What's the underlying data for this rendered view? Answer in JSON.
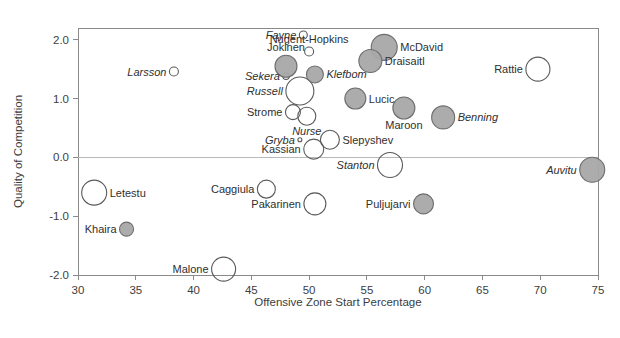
{
  "chart_data": {
    "type": "scatter",
    "title": "",
    "xlabel": "Offensive Zone Start Percentage",
    "ylabel": "Quality of Competition",
    "xlim": [
      30,
      75
    ],
    "ylim": [
      -2.0,
      2.2
    ],
    "xticks": [
      30,
      35,
      40,
      45,
      50,
      55,
      60,
      65,
      70,
      75
    ],
    "yticks": [
      2.0,
      1.0,
      0.0,
      -1.0,
      -2.0
    ],
    "xtick_labels": [
      "30",
      "35",
      "40",
      "45",
      "50",
      "55",
      "60",
      "65",
      "70",
      "75"
    ],
    "ytick_labels": [
      "2.0",
      "1.0",
      "0.0",
      "-1.0",
      "-2.0"
    ],
    "grid": "horizontal gridline at y=0.0 only",
    "legend": "none",
    "marker_encoding": {
      "size": "bubble area encodes ice time / usage",
      "fill_gray": "#a8a8a8",
      "fill_open": "#ffffff",
      "stroke": "#5a5a5a"
    },
    "points": [
      {
        "name": "Fayne",
        "x": 49.5,
        "y": 2.08,
        "r": 4.0,
        "filled": false,
        "italic": true,
        "label_pos": "left"
      },
      {
        "name": "Nugent-Hopkins",
        "x": 50.0,
        "y": 1.8,
        "r": 4.5,
        "filled": false,
        "italic": false,
        "label_pos": "above"
      },
      {
        "name": "McDavid",
        "x": 56.5,
        "y": 1.87,
        "r": 13.0,
        "filled": true,
        "italic": false,
        "label_pos": "right"
      },
      {
        "name": "Jokinen",
        "x": 48.0,
        "y": 1.55,
        "r": 11.0,
        "filled": true,
        "italic": false,
        "label_pos": "above"
      },
      {
        "name": "Draisaitl",
        "x": 55.3,
        "y": 1.64,
        "r": 11.5,
        "filled": true,
        "italic": false,
        "label_pos": "right"
      },
      {
        "name": "Larsson",
        "x": 38.3,
        "y": 1.46,
        "r": 4.5,
        "filled": false,
        "italic": true,
        "label_pos": "left"
      },
      {
        "name": "Rattie",
        "x": 69.8,
        "y": 1.5,
        "r": 12.0,
        "filled": false,
        "italic": false,
        "label_pos": "left"
      },
      {
        "name": "Sekera",
        "x": 48.0,
        "y": 1.38,
        "r": 3.2,
        "filled": false,
        "italic": true,
        "label_pos": "left"
      },
      {
        "name": "Klefbom",
        "x": 50.5,
        "y": 1.41,
        "r": 8.5,
        "filled": true,
        "italic": true,
        "label_pos": "right"
      },
      {
        "name": "Russell",
        "x": 49.2,
        "y": 1.13,
        "r": 14.0,
        "filled": false,
        "italic": true,
        "label_pos": "left"
      },
      {
        "name": "Lucic",
        "x": 54.0,
        "y": 1.0,
        "r": 10.5,
        "filled": true,
        "italic": false,
        "label_pos": "right"
      },
      {
        "name": "Maroon",
        "x": 58.2,
        "y": 0.84,
        "r": 11.0,
        "filled": true,
        "italic": false,
        "label_pos": "below"
      },
      {
        "name": "Strome",
        "x": 48.6,
        "y": 0.77,
        "r": 7.5,
        "filled": false,
        "italic": false,
        "label_pos": "left"
      },
      {
        "name": "Nurse",
        "x": 49.8,
        "y": 0.7,
        "r": 9.0,
        "filled": false,
        "italic": true,
        "label_pos": "below"
      },
      {
        "name": "Benning",
        "x": 61.6,
        "y": 0.68,
        "r": 11.5,
        "filled": true,
        "italic": true,
        "label_pos": "right"
      },
      {
        "name": "Gryba",
        "x": 49.2,
        "y": 0.3,
        "r": 2.0,
        "filled": false,
        "italic": true,
        "label_pos": "left"
      },
      {
        "name": "Slepyshev",
        "x": 51.8,
        "y": 0.3,
        "r": 9.5,
        "filled": false,
        "italic": false,
        "label_pos": "right"
      },
      {
        "name": "Kassian",
        "x": 50.4,
        "y": 0.14,
        "r": 10.0,
        "filled": false,
        "italic": false,
        "label_pos": "left"
      },
      {
        "name": "Stanton",
        "x": 57.0,
        "y": -0.13,
        "r": 12.5,
        "filled": false,
        "italic": true,
        "label_pos": "left"
      },
      {
        "name": "Auvitu",
        "x": 74.5,
        "y": -0.21,
        "r": 12.5,
        "filled": true,
        "italic": true,
        "label_pos": "left"
      },
      {
        "name": "Letestu",
        "x": 31.4,
        "y": -0.6,
        "r": 12.5,
        "filled": false,
        "italic": false,
        "label_pos": "right"
      },
      {
        "name": "Caggiula",
        "x": 46.3,
        "y": -0.54,
        "r": 9.0,
        "filled": false,
        "italic": false,
        "label_pos": "left"
      },
      {
        "name": "Pakarinen",
        "x": 50.5,
        "y": -0.79,
        "r": 11.0,
        "filled": false,
        "italic": false,
        "label_pos": "left"
      },
      {
        "name": "Puljujarvi",
        "x": 59.9,
        "y": -0.79,
        "r": 10.0,
        "filled": true,
        "italic": false,
        "label_pos": "left"
      },
      {
        "name": "Khaira",
        "x": 34.2,
        "y": -1.22,
        "r": 7.0,
        "filled": true,
        "italic": false,
        "label_pos": "left"
      },
      {
        "name": "Malone",
        "x": 42.6,
        "y": -1.9,
        "r": 12.0,
        "filled": false,
        "italic": false,
        "label_pos": "left"
      }
    ]
  },
  "axes": {
    "x_title": "Offensive Zone Start Percentage",
    "y_title": "Quality of Competition"
  }
}
